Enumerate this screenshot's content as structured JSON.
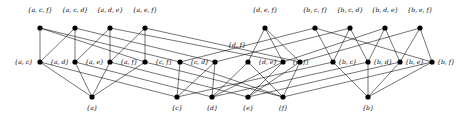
{
  "figure": {
    "type": "hasse-diagram",
    "title": "",
    "background": "#ffffff",
    "node_color": "#000000",
    "edge_color": "#000000",
    "width": 456,
    "height": 116
  },
  "rows": {
    "top_label": "3-element subsets",
    "middle_label": "2-element subsets",
    "bottom_label": "1-element subsets"
  },
  "nodes": {
    "top": [
      {
        "id": "acf",
        "label": "{a, c, f}",
        "x": 40,
        "y": 28,
        "lx": 40,
        "ly": 12,
        "anchor": "middle"
      },
      {
        "id": "acd",
        "label": "{a, c, d}",
        "x": 75,
        "y": 28,
        "lx": 75,
        "ly": 12,
        "anchor": "middle"
      },
      {
        "id": "ade",
        "label": "{a, d, e}",
        "x": 110,
        "y": 28,
        "lx": 110,
        "ly": 12,
        "anchor": "middle"
      },
      {
        "id": "aef",
        "label": "{a, e, f}",
        "x": 145,
        "y": 28,
        "lx": 145,
        "ly": 12,
        "anchor": "middle"
      },
      {
        "id": "def",
        "label": "{d, e, f}",
        "x": 265,
        "y": 28,
        "lx": 265,
        "ly": 12,
        "anchor": "middle"
      },
      {
        "id": "bcf",
        "label": "{b, c, f}",
        "x": 315,
        "y": 28,
        "lx": 315,
        "ly": 12,
        "anchor": "middle"
      },
      {
        "id": "bcd",
        "label": "{b, c, d}",
        "x": 350,
        "y": 28,
        "lx": 350,
        "ly": 12,
        "anchor": "middle"
      },
      {
        "id": "bde",
        "label": "{b, d, e}",
        "x": 385,
        "y": 28,
        "lx": 385,
        "ly": 12,
        "anchor": "middle"
      },
      {
        "id": "bef",
        "label": "{b, e, f}",
        "x": 420,
        "y": 28,
        "lx": 420,
        "ly": 12,
        "anchor": "middle"
      }
    ],
    "middle": [
      {
        "id": "ac",
        "label": "{a, c}",
        "x": 40,
        "y": 62,
        "lx": 33,
        "ly": 64,
        "anchor": "end"
      },
      {
        "id": "ad",
        "label": "{a, d}",
        "x": 75,
        "y": 62,
        "lx": 50,
        "ly": 64,
        "anchor": "start"
      },
      {
        "id": "ae",
        "label": "{a, e}",
        "x": 110,
        "y": 62,
        "lx": 85,
        "ly": 64,
        "anchor": "start"
      },
      {
        "id": "af",
        "label": "{a, f}",
        "x": 145,
        "y": 62,
        "lx": 120,
        "ly": 64,
        "anchor": "start"
      },
      {
        "id": "cf",
        "label": "{c, f}",
        "x": 180,
        "y": 62,
        "lx": 155,
        "ly": 64,
        "anchor": "start"
      },
      {
        "id": "cd",
        "label": "{c, d}",
        "x": 215,
        "y": 62,
        "lx": 190,
        "ly": 64,
        "anchor": "start"
      },
      {
        "id": "df",
        "label": "{d, f}",
        "x": 248,
        "y": 62,
        "lx": 228,
        "ly": 47,
        "anchor": "start"
      },
      {
        "id": "de",
        "label": "{d, e}",
        "x": 283,
        "y": 62,
        "lx": 258,
        "ly": 64,
        "anchor": "start"
      },
      {
        "id": "ef",
        "label": "{e, f}",
        "x": 300,
        "y": 62,
        "lx": 292,
        "ly": 64,
        "anchor": "start"
      },
      {
        "id": "bc",
        "label": "{b, c}",
        "x": 333,
        "y": 62,
        "lx": 338,
        "ly": 64,
        "anchor": "start"
      },
      {
        "id": "bd",
        "label": "{b, d}",
        "x": 368,
        "y": 62,
        "lx": 373,
        "ly": 64,
        "anchor": "start"
      },
      {
        "id": "be",
        "label": "{b, e}",
        "x": 400,
        "y": 62,
        "lx": 405,
        "ly": 64,
        "anchor": "start"
      },
      {
        "id": "bf",
        "label": "{b, f}",
        "x": 432,
        "y": 62,
        "lx": 437,
        "ly": 64,
        "anchor": "start"
      }
    ],
    "bottom": [
      {
        "id": "a",
        "label": "{a}",
        "x": 92,
        "y": 97,
        "lx": 92,
        "ly": 110,
        "anchor": "middle"
      },
      {
        "id": "c",
        "label": "{c}",
        "x": 177,
        "y": 97,
        "lx": 177,
        "ly": 110,
        "anchor": "middle"
      },
      {
        "id": "d",
        "label": "{d}",
        "x": 212,
        "y": 97,
        "lx": 212,
        "ly": 110,
        "anchor": "middle"
      },
      {
        "id": "e",
        "label": "{e}",
        "x": 248,
        "y": 97,
        "lx": 248,
        "ly": 110,
        "anchor": "middle"
      },
      {
        "id": "f",
        "label": "{f}",
        "x": 283,
        "y": 97,
        "lx": 283,
        "ly": 110,
        "anchor": "middle"
      },
      {
        "id": "b",
        "label": "{b}",
        "x": 368,
        "y": 97,
        "lx": 368,
        "ly": 110,
        "anchor": "middle"
      }
    ]
  },
  "edges": {
    "top_to_middle": [
      [
        "acf",
        "ac"
      ],
      [
        "acf",
        "cf"
      ],
      [
        "acf",
        "af"
      ],
      [
        "acd",
        "ac"
      ],
      [
        "acd",
        "cd"
      ],
      [
        "acd",
        "ad"
      ],
      [
        "ade",
        "ad"
      ],
      [
        "ade",
        "de"
      ],
      [
        "ade",
        "ae"
      ],
      [
        "aef",
        "ae"
      ],
      [
        "aef",
        "ef"
      ],
      [
        "aef",
        "af"
      ],
      [
        "def",
        "de"
      ],
      [
        "def",
        "ef"
      ],
      [
        "def",
        "df"
      ],
      [
        "bcf",
        "bc"
      ],
      [
        "bcf",
        "cf"
      ],
      [
        "bcf",
        "bf"
      ],
      [
        "bcd",
        "bc"
      ],
      [
        "bcd",
        "cd"
      ],
      [
        "bcd",
        "bd"
      ],
      [
        "bde",
        "bd"
      ],
      [
        "bde",
        "de"
      ],
      [
        "bde",
        "be"
      ],
      [
        "bef",
        "be"
      ],
      [
        "bef",
        "ef"
      ],
      [
        "bef",
        "bf"
      ]
    ],
    "middle_to_bottom": [
      [
        "ac",
        "a"
      ],
      [
        "ac",
        "c"
      ],
      [
        "ad",
        "a"
      ],
      [
        "ad",
        "d"
      ],
      [
        "ae",
        "a"
      ],
      [
        "ae",
        "e"
      ],
      [
        "af",
        "a"
      ],
      [
        "af",
        "f"
      ],
      [
        "cf",
        "c"
      ],
      [
        "cf",
        "f"
      ],
      [
        "cd",
        "c"
      ],
      [
        "cd",
        "d"
      ],
      [
        "df",
        "d"
      ],
      [
        "df",
        "f"
      ],
      [
        "de",
        "d"
      ],
      [
        "de",
        "e"
      ],
      [
        "ef",
        "e"
      ],
      [
        "ef",
        "f"
      ],
      [
        "bc",
        "b"
      ],
      [
        "bc",
        "c"
      ],
      [
        "bd",
        "b"
      ],
      [
        "bd",
        "d"
      ],
      [
        "be",
        "b"
      ],
      [
        "be",
        "e"
      ],
      [
        "bf",
        "b"
      ],
      [
        "bf",
        "f"
      ]
    ]
  }
}
